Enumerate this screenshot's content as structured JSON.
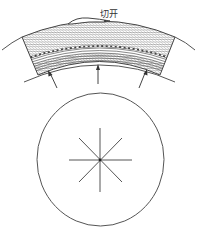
{
  "diagram": {
    "label": "切开",
    "colors": {
      "stroke": "#555555",
      "hatch": "#777777",
      "background": "#ffffff",
      "dashed_line": "#ffffff"
    },
    "elements": {
      "band": "curved hatched layered band (section of wall)",
      "incision_mark": "bulge at top of band",
      "arrows": [
        "left-arrow",
        "center-arrow",
        "right-arrow"
      ],
      "circle": "cross-section circle",
      "star": "8-spoke radial star centered in circle"
    }
  }
}
